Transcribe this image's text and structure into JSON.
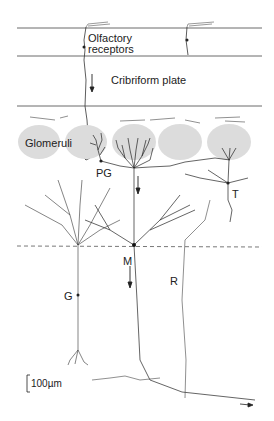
{
  "diagram": {
    "type": "olfactory-bulb-circuit",
    "labels": {
      "olfactory_receptors_line1": "Olfactory",
      "olfactory_receptors_line2": "receptors",
      "cribriform_plate": "Cribriform plate",
      "glomeruli": "Glomeruli",
      "periglomerular_cell": "PG",
      "tufted_cell": "T",
      "mitral_cell": "M",
      "granule_cell": "G",
      "recurrent_collateral": "R",
      "scale_bar": "100µm"
    },
    "colors": {
      "glomerulus_fill": "#dcdcdc",
      "line": "#333333",
      "dashed_line": "#555555"
    },
    "layers": [
      "Olfactory receptors",
      "Cribriform plate",
      "Glomeruli",
      "Mitral cell layer (dashed)",
      "Granule layer"
    ]
  }
}
